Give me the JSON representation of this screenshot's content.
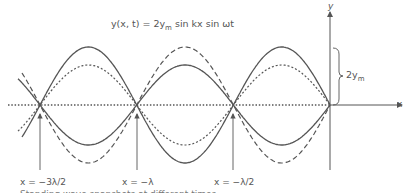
{
  "equation": {
    "lhs": "y(x, t) = 2y",
    "sub": "m",
    "rhs": " sin kx sin ωt"
  },
  "axes": {
    "x_label": "x",
    "y_label": "y"
  },
  "amplitude_label": {
    "text": "2y",
    "sub": "m"
  },
  "node_labels": [
    {
      "text": "x = −3λ/2"
    },
    {
      "text": "x = −λ"
    },
    {
      "text": "x = −λ/2"
    }
  ],
  "caption_cutoff": "Standing wave snapshots at different times",
  "colors": {
    "line": "#555555",
    "background": "#ffffff"
  },
  "geometry": {
    "x_axis_y": 105,
    "y_axis_x": 330,
    "node_x": [
      40,
      137,
      233,
      330
    ],
    "half_wavelength_px": 96.7,
    "amplitude_large_px": 58,
    "amplitude_small_px": 40
  }
}
